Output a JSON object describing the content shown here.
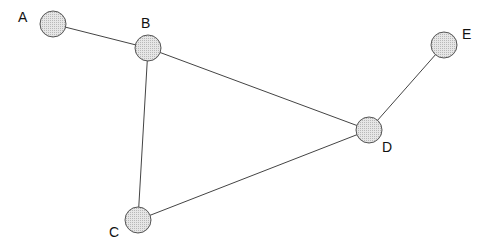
{
  "diagram": {
    "type": "undirected-graph",
    "nodes": [
      {
        "id": "A",
        "label": "A",
        "x": 53,
        "y": 24,
        "lx": 18,
        "ly": 22
      },
      {
        "id": "B",
        "label": "B",
        "x": 148,
        "y": 48,
        "lx": 141,
        "ly": 28
      },
      {
        "id": "C",
        "label": "C",
        "x": 138,
        "y": 220,
        "lx": 109,
        "ly": 237
      },
      {
        "id": "D",
        "label": "D",
        "x": 369,
        "y": 130,
        "lx": 382,
        "ly": 152
      },
      {
        "id": "E",
        "label": "E",
        "x": 444,
        "y": 45,
        "lx": 462,
        "ly": 39
      }
    ],
    "edges": [
      {
        "from": "A",
        "to": "B"
      },
      {
        "from": "B",
        "to": "D"
      },
      {
        "from": "B",
        "to": "C"
      },
      {
        "from": "C",
        "to": "D"
      },
      {
        "from": "D",
        "to": "E"
      }
    ],
    "node_radius": 13,
    "node_fill": "#dcdcdc",
    "node_stroke": "#555555",
    "edge_color": "#444444"
  }
}
